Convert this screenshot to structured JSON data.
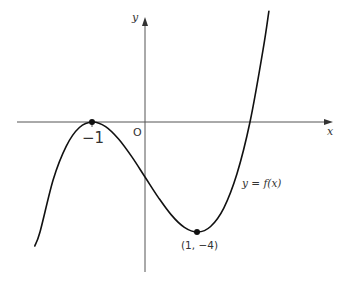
{
  "labels": {
    "y_axis": "y",
    "x_axis": "x",
    "origin": "O",
    "x_tick_label": "−1",
    "min_point": "(1, −4)",
    "function": "y = f(x)"
  },
  "colors": {
    "axes": "#555555",
    "curve": "#111111",
    "text": "#333333"
  },
  "chart_data": {
    "type": "line",
    "title": "",
    "xlabel": "x",
    "ylabel": "y",
    "function_label": "y = f(x)",
    "implied_function": "f(x) = (x + 1)^2 (x − 2)",
    "grid": false,
    "legend": null,
    "xlim": [
      -2.4,
      3.5
    ],
    "ylim": [
      -5.5,
      4.0
    ],
    "annotations": [
      {
        "text": "−1",
        "x": -1,
        "y": 0,
        "kind": "turning point (maximum), touches x-axis"
      },
      {
        "text": "(1, −4)",
        "x": 1,
        "y": -4,
        "kind": "turning point (minimum)"
      },
      {
        "text": "O",
        "x": 0,
        "y": 0,
        "kind": "origin"
      }
    ],
    "series": [
      {
        "name": "y = f(x)",
        "x": [
          -2.1,
          -2.0,
          -1.75,
          -1.5,
          -1.25,
          -1.0,
          -0.75,
          -0.5,
          -0.25,
          0.0,
          0.25,
          0.5,
          0.75,
          1.0,
          1.25,
          1.5,
          1.75,
          2.0,
          2.25,
          2.36
        ],
        "y": [
          -4.51,
          -4.0,
          -2.11,
          -0.88,
          -0.2,
          0.0,
          -0.17,
          -0.63,
          -1.27,
          -2.0,
          -2.73,
          -3.38,
          -3.83,
          -4.0,
          -3.8,
          -3.13,
          -1.89,
          0.0,
          2.64,
          4.03
        ]
      }
    ],
    "key_points": [
      {
        "x": -1,
        "y": 0,
        "marked": true
      },
      {
        "x": 1,
        "y": -4,
        "marked": true
      },
      {
        "x": 2,
        "y": 0,
        "marked": false
      },
      {
        "x": 0,
        "y": -2,
        "marked": false
      }
    ]
  }
}
